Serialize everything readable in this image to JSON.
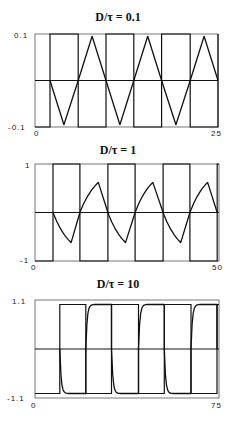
{
  "chart_data": [
    {
      "type": "line",
      "title": "D/τ = 0.1",
      "xlabel": "",
      "ylabel": "",
      "xlim": [
        0,
        25
      ],
      "ylim": [
        -0.1,
        0.1
      ],
      "x_ticks": [
        "0",
        "25"
      ],
      "y_ticks": [
        "0.1",
        "-0.1"
      ],
      "grid": false,
      "legend": null,
      "zero_line": true,
      "square_wave": {
        "amplitude": 0.1,
        "start_level": -0.1,
        "switch_times": [
          2.05,
          5.9,
          9.7,
          13.5,
          17.3,
          21.2,
          25.0
        ]
      },
      "series": [
        {
          "name": "response",
          "shape": "triangle",
          "x": [
            2.05,
            3.95,
            5.9,
            7.8,
            9.7,
            11.6,
            13.5,
            15.4,
            17.3,
            19.25,
            21.2,
            23.1,
            25.0
          ],
          "y": [
            0,
            -0.095,
            0,
            0.095,
            0,
            -0.095,
            0,
            0.095,
            0,
            -0.095,
            0,
            0.095,
            0
          ]
        }
      ]
    },
    {
      "type": "line",
      "title": "D/τ = 1",
      "xlabel": "",
      "ylabel": "",
      "xlim": [
        0,
        50
      ],
      "ylim": [
        -1,
        1
      ],
      "x_ticks": [
        "0",
        "50"
      ],
      "y_ticks": [
        "1",
        "-1"
      ],
      "grid": false,
      "legend": null,
      "zero_line": true,
      "square_wave": {
        "amplitude": 1,
        "start_level": -1,
        "switch_times": [
          4.9,
          12.2,
          19.8,
          27.2,
          34.8,
          42.1,
          49.5
        ]
      },
      "series": [
        {
          "name": "response",
          "shape": "exponential-rise-then-linear-return",
          "x": [
            4.9,
            9.8,
            12.2,
            17.2,
            19.8,
            24.6,
            27.2,
            32.0,
            34.8,
            39.6,
            42.1,
            46.9,
            49.5
          ],
          "y": [
            0,
            -0.62,
            0,
            0.62,
            0,
            -0.62,
            0,
            0.62,
            0,
            -0.62,
            0,
            0.62,
            0
          ]
        }
      ]
    },
    {
      "type": "line",
      "title": "D/τ = 10",
      "xlabel": "",
      "ylabel": "",
      "xlim": [
        0,
        75
      ],
      "ylim": [
        -1.1,
        1.1
      ],
      "x_ticks": [
        "0",
        "75"
      ],
      "y_ticks": [
        "1.1",
        "-1.1"
      ],
      "grid": false,
      "legend": null,
      "zero_line": true,
      "square_wave": {
        "amplitude": 1,
        "start_level": -1,
        "switch_times": [
          10.1,
          20.7,
          31.2,
          42.2,
          52.7,
          63.6,
          74.2
        ]
      },
      "series": [
        {
          "name": "response",
          "shape": "fast-exponential-saturation",
          "x": [
            10.1,
            12.0,
            20.7,
            22.6,
            31.2,
            33.1,
            42.2,
            44.1,
            52.7,
            54.6,
            63.6,
            65.5,
            74.2
          ],
          "y": [
            0,
            -0.98,
            0,
            0.98,
            0,
            -0.98,
            0,
            0.98,
            0,
            -0.98,
            0,
            0.98,
            0
          ]
        }
      ]
    }
  ],
  "panels": [
    {
      "title": "D/τ = 0.1",
      "y_top_label": "0.1",
      "y_bottom_label": "-0.1",
      "x_left_label": "0",
      "x_right_label": "25"
    },
    {
      "title": "D/τ = 1",
      "y_top_label": "1",
      "y_bottom_label": "-1",
      "x_left_label": "0",
      "x_right_label": "50"
    },
    {
      "title": "D/τ = 10",
      "y_top_label": "1.1",
      "y_bottom_label": "-1.1",
      "x_left_label": "0",
      "x_right_label": "75"
    }
  ],
  "colors": {
    "line": "#111111",
    "frame": "#555555",
    "background": "#ffffff"
  }
}
